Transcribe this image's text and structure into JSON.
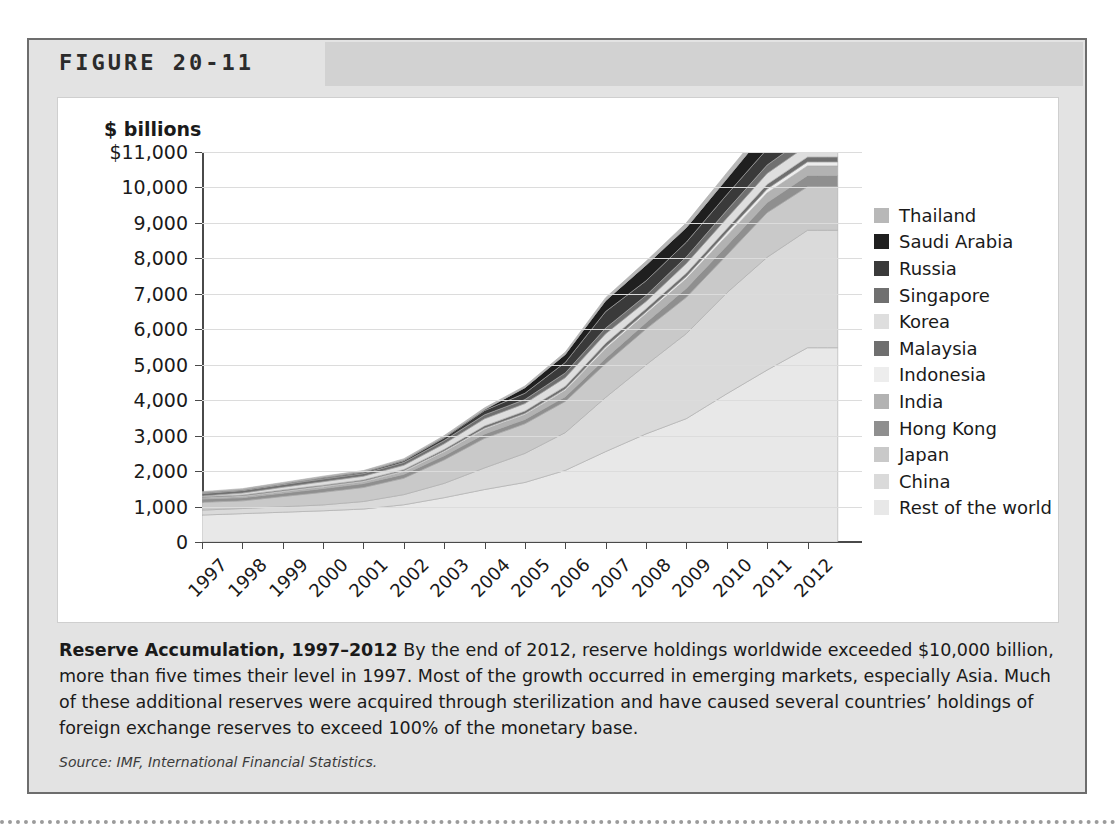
{
  "figure": {
    "number_label": "FIGURE 20-11",
    "caption_title": "Reserve Accumulation, 1997–2012",
    "caption_body": " By the end of 2012, reserve holdings worldwide exceeded $10,000 billion, more than five times their level in 1997. Most of the growth occurred in emerging markets, especially Asia. Much of these additional reserves were acquired through sterilization and have caused several countries’ holdings of foreign exchange reserves to exceed 100% of the monetary base.",
    "source": "Source: IMF, International Financial Statistics."
  },
  "chart_data": {
    "type": "area",
    "stacked": true,
    "title": "",
    "xlabel": "",
    "ylabel": "$ billions",
    "ylim": [
      0,
      11000
    ],
    "ytick_values": [
      0,
      1000,
      2000,
      3000,
      4000,
      5000,
      6000,
      7000,
      8000,
      9000,
      10000,
      11000
    ],
    "ytick_labels": [
      "0",
      "1,000",
      "2,000",
      "3,000",
      "4,000",
      "5,000",
      "6,000",
      "7,000",
      "8,000",
      "9,000",
      "10,000",
      "$11,000"
    ],
    "grid": true,
    "legend_position": "right",
    "x": [
      1997,
      1998,
      1999,
      2000,
      2001,
      2002,
      2003,
      2004,
      2005,
      2006,
      2007,
      2008,
      2009,
      2010,
      2011,
      2012
    ],
    "xtick_labels": [
      "1997",
      "1998",
      "1999",
      "2000",
      "2001",
      "2002",
      "2003",
      "2004",
      "2005",
      "2006",
      "2007",
      "2008",
      "2009",
      "2010",
      "2011",
      "2012"
    ],
    "series_order_bottom_to_top": [
      "Rest of the world",
      "China",
      "Japan",
      "Hong Kong",
      "India",
      "Indonesia",
      "Malaysia",
      "Korea",
      "Singapore",
      "Russia",
      "Saudi Arabia",
      "Thailand"
    ],
    "series": [
      {
        "name": "Rest of the world",
        "color": "#e8e8e8",
        "values": [
          760,
          800,
          840,
          880,
          930,
          1050,
          1250,
          1480,
          1680,
          2020,
          2550,
          3050,
          3480,
          4180,
          4850,
          5480
        ]
      },
      {
        "name": "China",
        "color": "#dadada",
        "values": [
          140,
          145,
          155,
          166,
          212,
          286,
          403,
          610,
          819,
          1066,
          1528,
          1946,
          2399,
          2847,
          3181,
          3312
        ]
      },
      {
        "name": "Japan",
        "color": "#c9c9c9",
        "values": [
          220,
          215,
          287,
          355,
          395,
          461,
          663,
          833,
          834,
          880,
          953,
          1011,
          1022,
          1062,
          1258,
          1227
        ]
      },
      {
        "name": "Hong Kong",
        "color": "#8f8f8f",
        "values": [
          93,
          90,
          96,
          108,
          111,
          112,
          118,
          124,
          124,
          133,
          153,
          182,
          256,
          269,
          285,
          317
        ]
      },
      {
        "name": "India",
        "color": "#b2b2b2",
        "values": [
          25,
          28,
          33,
          38,
          46,
          68,
          99,
          127,
          132,
          171,
          267,
          248,
          266,
          276,
          271,
          271
        ]
      },
      {
        "name": "Indonesia",
        "color": "#ededed",
        "values": [
          17,
          23,
          27,
          29,
          28,
          32,
          36,
          36,
          35,
          43,
          57,
          52,
          66,
          96,
          110,
          113
        ]
      },
      {
        "name": "Malaysia",
        "color": "#6f6f6f",
        "values": [
          21,
          26,
          31,
          28,
          31,
          34,
          44,
          66,
          70,
          82,
          101,
          92,
          96,
          106,
          133,
          140
        ]
      },
      {
        "name": "Korea",
        "color": "#dedede",
        "values": [
          20,
          52,
          74,
          96,
          103,
          121,
          155,
          199,
          210,
          239,
          262,
          201,
          270,
          292,
          307,
          327
        ]
      },
      {
        "name": "Singapore",
        "color": "#707070",
        "values": [
          71,
          75,
          77,
          80,
          75,
          82,
          96,
          113,
          116,
          136,
          163,
          174,
          188,
          226,
          238,
          259
        ]
      },
      {
        "name": "Russia",
        "color": "#3a3a3a",
        "values": [
          13,
          8,
          9,
          25,
          33,
          44,
          73,
          121,
          176,
          296,
          467,
          411,
          416,
          443,
          454,
          486
        ]
      },
      {
        "name": "Saudi Arabia",
        "color": "#1f1f1f",
        "values": [
          14,
          14,
          16,
          20,
          18,
          21,
          23,
          27,
          155,
          225,
          306,
          442,
          410,
          445,
          541,
          657
        ]
      },
      {
        "name": "Thailand",
        "color": "#b8b8b8",
        "values": [
          26,
          29,
          34,
          32,
          33,
          38,
          41,
          48,
          50,
          65,
          85,
          109,
          135,
          167,
          167,
          174
        ]
      }
    ]
  },
  "legend": {
    "items": [
      {
        "label": "Thailand",
        "color": "#b8b8b8"
      },
      {
        "label": "Saudi Arabia",
        "color": "#1f1f1f"
      },
      {
        "label": "Russia",
        "color": "#3a3a3a"
      },
      {
        "label": "Singapore",
        "color": "#707070"
      },
      {
        "label": "Korea",
        "color": "#dedede"
      },
      {
        "label": "Malaysia",
        "color": "#6f6f6f"
      },
      {
        "label": "Indonesia",
        "color": "#ededed"
      },
      {
        "label": "India",
        "color": "#b2b2b2"
      },
      {
        "label": "Hong Kong",
        "color": "#8f8f8f"
      },
      {
        "label": "Japan",
        "color": "#c9c9c9"
      },
      {
        "label": "China",
        "color": "#dadada"
      },
      {
        "label": "Rest of the world",
        "color": "#e8e8e8"
      }
    ]
  }
}
